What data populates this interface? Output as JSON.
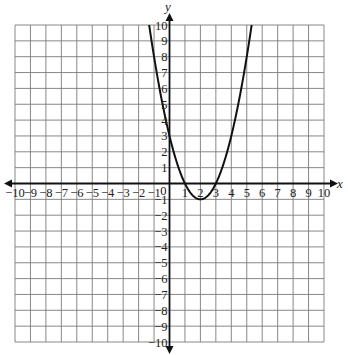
{
  "chart_data": {
    "type": "line",
    "title": "",
    "xlabel": "x",
    "ylabel": "y",
    "xlim": [
      -10,
      10
    ],
    "ylim": [
      -10,
      10
    ],
    "grid": true,
    "x_ticks": [
      -10,
      -9,
      -8,
      -7,
      -6,
      -5,
      -4,
      -3,
      -2,
      -1,
      1,
      2,
      3,
      4,
      5,
      6,
      7,
      8,
      9,
      10
    ],
    "y_ticks": [
      -10,
      -9,
      -8,
      -7,
      -6,
      -5,
      -4,
      -3,
      -2,
      -1,
      1,
      2,
      3,
      4,
      5,
      6,
      7,
      8,
      9,
      10
    ],
    "origin_label": "0",
    "series": [
      {
        "name": "parabola",
        "equation": "y = x^2 - 4x + 3",
        "vertex": [
          2,
          -1
        ],
        "x_intercepts": [
          1,
          3
        ],
        "y_intercept": 3,
        "x": [
          -1.6,
          -1,
          0,
          1,
          2,
          3,
          4,
          5,
          5.6
        ],
        "y": [
          12.0,
          8,
          3,
          0,
          -1,
          0,
          3,
          8,
          11.96
        ]
      }
    ]
  },
  "labels": {
    "x_axis": "x",
    "y_axis": "y",
    "origin": "0"
  }
}
